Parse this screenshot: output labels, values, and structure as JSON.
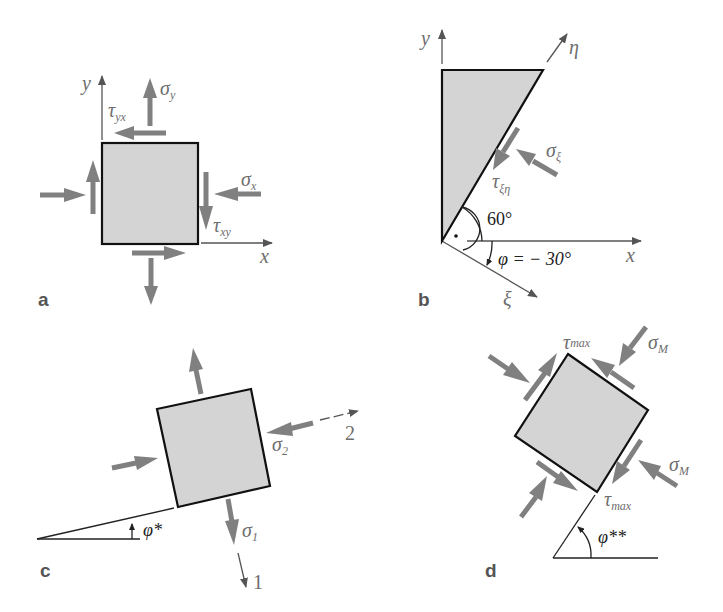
{
  "figure": {
    "colors": {
      "element_fill": "#d4d4d4",
      "element_stroke": "#111111",
      "arrow": "#808080",
      "axis": "#555555",
      "label": "#6e6e6e"
    }
  },
  "panels": {
    "a": {
      "label": "a",
      "axis_x": "x",
      "axis_y": "y",
      "sigma_x": "σ",
      "sigma_x_sub": "x",
      "sigma_y": "σ",
      "sigma_y_sub": "y",
      "tau_xy": "τ",
      "tau_xy_sub": "xy",
      "tau_yx": "τ",
      "tau_yx_sub": "yx"
    },
    "b": {
      "label": "b",
      "axis_x": "x",
      "axis_y": "y",
      "axis_eta": "η",
      "axis_xi": "ξ",
      "sigma_xi": "σ",
      "sigma_xi_sub": "ξ",
      "tau_xi_eta": "τ",
      "tau_xi_eta_sub": "ξη",
      "angle_60": "60°",
      "phi_eq": "φ = − 30°"
    },
    "c": {
      "label": "c",
      "axis_1": "1",
      "axis_2": "2",
      "sigma_1": "σ",
      "sigma_1_sub": "1",
      "sigma_2": "σ",
      "sigma_2_sub": "2",
      "phi_star": "φ*"
    },
    "d": {
      "label": "d",
      "sigma_M_top": "σ",
      "sigma_M_top_sub": "M",
      "sigma_M_bottom": "σ",
      "sigma_M_bottom_sub": "M",
      "tau_max_top": "τ",
      "tau_max_top_sub": "max",
      "tau_max_bottom": "τ",
      "tau_max_bottom_sub": "max",
      "phi_star_star": "φ**"
    }
  }
}
